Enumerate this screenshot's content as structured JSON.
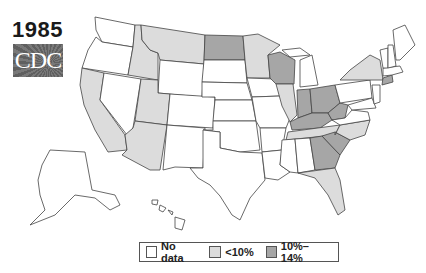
{
  "title": {
    "year": "1985",
    "logo_text": "CDC"
  },
  "legend": {
    "items": [
      {
        "label": "No data",
        "color": "#ffffff"
      },
      {
        "label": "<10%",
        "color": "#dcdcdc"
      },
      {
        "label": "10%–14%",
        "color": "#a6a6a6"
      }
    ]
  },
  "map": {
    "categories": {
      "no_data": [
        "WA",
        "OR",
        "NV",
        "WY",
        "NE",
        "KS",
        "CO",
        "NM",
        "TX",
        "OK",
        "IA",
        "MO",
        "AR",
        "LA",
        "MS",
        "AL",
        "MI",
        "PA",
        "NY_excluded",
        "VT",
        "NH",
        "ME",
        "MA",
        "NJ",
        "DE",
        "MD",
        "VA",
        "AK",
        "HI",
        "SD"
      ],
      "under_10": [
        "CA",
        "ID",
        "MT",
        "UT",
        "AZ",
        "MN",
        "IL",
        "TN",
        "NC",
        "FL",
        "NY"
      ],
      "10_to_14": [
        "ND",
        "WI",
        "IN",
        "OH",
        "KY",
        "WV",
        "GA",
        "SC",
        "CT"
      ]
    }
  }
}
